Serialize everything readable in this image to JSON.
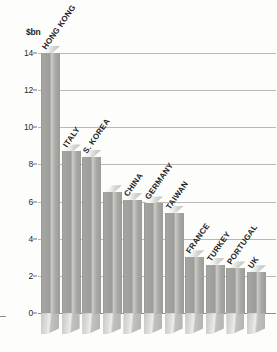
{
  "chart_data": {
    "type": "bar",
    "title": "",
    "subtitle": "",
    "xlabel": "",
    "ylabel": "$bn",
    "ylim": [
      0,
      14
    ],
    "yticks": [
      14,
      12,
      10,
      8,
      6,
      4,
      2,
      0
    ],
    "grid": true,
    "legend": "none",
    "orientation": "vertical",
    "style": "3d-grayscale",
    "categories": [
      "HONG KONG",
      "ITALY",
      "S. KOREA",
      "CHINA",
      "GERMANY",
      "TAIWAN",
      "FRANCE",
      "TURKEY",
      "PORTUGAL",
      "UK"
    ],
    "values": [
      14.0,
      8.7,
      8.4,
      6.1,
      5.9,
      5.4,
      3.0,
      2.6,
      2.4,
      2.2
    ],
    "bars": [
      {
        "label": "HONG KONG",
        "value": 14.0
      },
      {
        "label": "ITALY",
        "value": 8.7
      },
      {
        "label": "S. KOREA",
        "value": 8.4
      },
      {
        "label": "",
        "value": 6.5
      },
      {
        "label": "CHINA",
        "value": 6.1
      },
      {
        "label": "GERMANY",
        "value": 5.9
      },
      {
        "label": "TAIWAN",
        "value": 5.4
      },
      {
        "label": "FRANCE",
        "value": 3.0
      },
      {
        "label": "TURKEY",
        "value": 2.6
      },
      {
        "label": "PORTUGAL",
        "value": 2.4
      },
      {
        "label": "UK",
        "value": 2.2
      }
    ]
  },
  "axis": {
    "unit_label": "$bn",
    "ticks": [
      "14",
      "12",
      "10",
      "8",
      "6",
      "4",
      "2",
      "0"
    ]
  },
  "colors": {
    "background": "#fdfdfc",
    "bar_face": "#a5a5a2",
    "bar_highlight": "#c9c9c6",
    "gridline": "#b9b9b6",
    "text": "#232323"
  }
}
